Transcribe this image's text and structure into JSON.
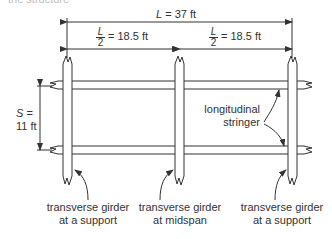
{
  "diagram": {
    "title_fragment": "the structure",
    "total_span": {
      "symbol": "L",
      "eq": "= 37 ft"
    },
    "half_span_left": {
      "num": "L",
      "den": "2",
      "eq": "= 18.5 ft"
    },
    "half_span_right": {
      "num": "L",
      "den": "2",
      "eq": "= 18.5 ft"
    },
    "spacing": {
      "symbol": "S",
      "eq": "=",
      "value": "11 ft"
    },
    "stringer_label": {
      "line1": "longitudinal",
      "line2": "stringer"
    },
    "girder_labels": [
      {
        "line1": "transverse girder",
        "line2": "at a support"
      },
      {
        "line1": "transverse girder",
        "line2": "at midspan"
      },
      {
        "line1": "transverse girder",
        "line2": "at a support"
      }
    ],
    "colors": {
      "line": "#333333",
      "background": "#ffffff"
    }
  }
}
